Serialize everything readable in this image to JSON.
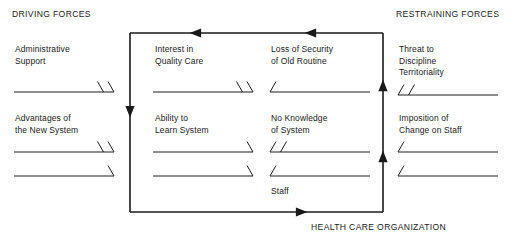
{
  "diagram": {
    "title_left": "DRIVING FORCES",
    "title_right": "RESTRAINING FORCES",
    "caption_bottom": "HEALTH CARE ORGANIZATION",
    "center_label": "Staff",
    "line_color": "#1a1a1a",
    "text_color": "#1a1a1a",
    "background": "#ffffff"
  },
  "columns": [
    {
      "name": "driving-outer",
      "side": "driving",
      "factors": [
        {
          "label": "Administrative\nSupport",
          "ticks": 2,
          "direction": "right"
        },
        {
          "label": "Advantages of\nthe New System",
          "ticks": 2,
          "direction": "right"
        }
      ],
      "extra_lines": [
        {
          "ticks": 1,
          "direction": "right"
        }
      ]
    },
    {
      "name": "driving-inner",
      "side": "driving",
      "factors": [
        {
          "label": "Interest in\nQuality Care",
          "ticks": 2,
          "direction": "right"
        },
        {
          "label": "Ability to\nLearn System",
          "ticks": 1,
          "direction": "right"
        }
      ],
      "extra_lines": [
        {
          "ticks": 1,
          "direction": "right"
        }
      ]
    },
    {
      "name": "restraining-inner",
      "side": "restraining",
      "factors": [
        {
          "label": "Loss of Security\nof Old Routine",
          "ticks": 1,
          "direction": "left"
        },
        {
          "label": "No Knowledge\nof System",
          "ticks": 2,
          "direction": "left"
        }
      ],
      "extra_lines": [
        {
          "ticks": 1,
          "direction": "left"
        }
      ]
    },
    {
      "name": "restraining-outer",
      "side": "restraining",
      "factors": [
        {
          "label": "Threat to\nDiscipline\nTerritoriality",
          "ticks": 2,
          "direction": "left"
        },
        {
          "label": "Imposition of\nChange on Staff",
          "ticks": 1,
          "direction": "left"
        }
      ],
      "extra_lines": [
        {
          "ticks": 1,
          "direction": "left"
        }
      ]
    }
  ],
  "flow_box": {
    "top_arrows": 2,
    "bottom_arrows": 1,
    "left_arrows": 1,
    "right_arrows": 2,
    "top_arrow_direction": "left",
    "bottom_arrow_direction": "right",
    "left_arrow_direction": "down",
    "right_arrow_direction": "up"
  }
}
